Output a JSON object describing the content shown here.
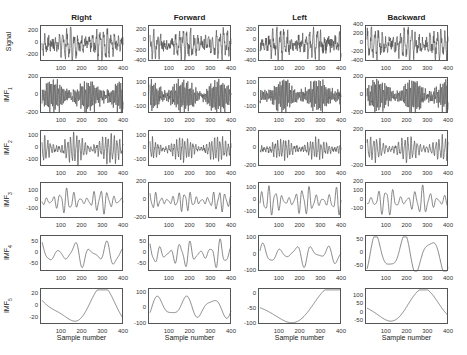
{
  "chart_data": {
    "type": "line",
    "layout": "6x4 grid of subplots",
    "columns": [
      "Right",
      "Forward",
      "Left",
      "Backward"
    ],
    "rows": [
      "Signal",
      "IMF1",
      "IMF2",
      "IMF3",
      "IMF4",
      "IMF5"
    ],
    "xlabel": "Sample number",
    "xlim": [
      0,
      400
    ],
    "xticks": [
      100,
      200,
      300,
      400
    ],
    "grid": false,
    "panels": [
      {
        "row": "Signal",
        "col": "Right",
        "yticks": [
          200,
          0,
          -200
        ],
        "ylim": [
          -300,
          300
        ],
        "freq": 22,
        "amp": 0.75,
        "noise": 0.5
      },
      {
        "row": "Signal",
        "col": "Forward",
        "yticks": [
          200,
          0,
          -200,
          -400
        ],
        "ylim": [
          -400,
          300
        ],
        "freq": 22,
        "amp": 0.7,
        "noise": 0.5
      },
      {
        "row": "Signal",
        "col": "Left",
        "yticks": [
          200,
          0,
          -200,
          -400
        ],
        "ylim": [
          -400,
          300
        ],
        "freq": 22,
        "amp": 0.7,
        "noise": 0.5
      },
      {
        "row": "Signal",
        "col": "Backward",
        "yticks": [
          400,
          200,
          0,
          -200,
          -400
        ],
        "ylim": [
          -400,
          400
        ],
        "freq": 22,
        "amp": 0.7,
        "noise": 0.5
      },
      {
        "row": "IMF1",
        "col": "Right",
        "yticks": [
          200,
          0,
          -200
        ],
        "ylim": [
          -200,
          200
        ],
        "freq": 60,
        "amp": 0.8,
        "noise": 0.3
      },
      {
        "row": "IMF1",
        "col": "Forward",
        "yticks": [
          100,
          0,
          -100
        ],
        "ylim": [
          -150,
          150
        ],
        "freq": 60,
        "amp": 0.8,
        "noise": 0.3
      },
      {
        "row": "IMF1",
        "col": "Left",
        "yticks": [
          100,
          0,
          -100
        ],
        "ylim": [
          -150,
          150
        ],
        "freq": 60,
        "amp": 0.8,
        "noise": 0.3
      },
      {
        "row": "IMF1",
        "col": "Backward",
        "yticks": [
          200,
          0,
          -200
        ],
        "ylim": [
          -200,
          200
        ],
        "freq": 60,
        "amp": 0.8,
        "noise": 0.3
      },
      {
        "row": "IMF2",
        "col": "Right",
        "yticks": [
          100,
          0,
          -100
        ],
        "ylim": [
          -150,
          150
        ],
        "freq": 28,
        "amp": 0.75,
        "noise": 0.15
      },
      {
        "row": "IMF2",
        "col": "Forward",
        "yticks": [
          100,
          0,
          -100
        ],
        "ylim": [
          -150,
          150
        ],
        "freq": 30,
        "amp": 0.6,
        "noise": 0.15
      },
      {
        "row": "IMF2",
        "col": "Left",
        "yticks": [
          200,
          0,
          -200
        ],
        "ylim": [
          -200,
          200
        ],
        "freq": 30,
        "amp": 0.5,
        "noise": 0.15
      },
      {
        "row": "IMF2",
        "col": "Backward",
        "yticks": [
          200,
          0,
          -200
        ],
        "ylim": [
          -200,
          200
        ],
        "freq": 26,
        "amp": 0.6,
        "noise": 0.1
      },
      {
        "row": "IMF3",
        "col": "Right",
        "yticks": [
          100,
          0,
          -100
        ],
        "ylim": [
          -200,
          200
        ],
        "freq": 12,
        "amp": 0.6,
        "noise": 0
      },
      {
        "row": "IMF3",
        "col": "Forward",
        "yticks": [
          200,
          0,
          -200
        ],
        "ylim": [
          -200,
          200
        ],
        "freq": 14,
        "amp": 0.5,
        "noise": 0
      },
      {
        "row": "IMF3",
        "col": "Left",
        "yticks": [
          100,
          0,
          -100
        ],
        "ylim": [
          -150,
          150
        ],
        "freq": 12,
        "amp": 0.7,
        "noise": 0
      },
      {
        "row": "IMF3",
        "col": "Backward",
        "yticks": [
          200,
          100,
          0,
          -100
        ],
        "ylim": [
          -200,
          200
        ],
        "freq": 11,
        "amp": 0.7,
        "noise": 0
      },
      {
        "row": "IMF4",
        "col": "Right",
        "yticks": [
          50,
          0,
          -50
        ],
        "ylim": [
          -80,
          80
        ],
        "freq": 5,
        "amp": 0.7,
        "noise": 0
      },
      {
        "row": "IMF4",
        "col": "Forward",
        "yticks": [
          50,
          0,
          -50
        ],
        "ylim": [
          -80,
          80
        ],
        "freq": 8,
        "amp": 0.7,
        "noise": 0
      },
      {
        "row": "IMF4",
        "col": "Left",
        "yticks": [
          100,
          0,
          -100
        ],
        "ylim": [
          -100,
          120
        ],
        "freq": 5,
        "amp": 0.6,
        "noise": 0
      },
      {
        "row": "IMF4",
        "col": "Backward",
        "yticks": [
          50,
          0,
          -50
        ],
        "ylim": [
          -70,
          70
        ],
        "freq": 3,
        "amp": 0.9,
        "noise": 0
      },
      {
        "row": "IMF5",
        "col": "Right",
        "yticks": [
          20,
          0,
          -20
        ],
        "ylim": [
          -30,
          30
        ],
        "freq": 1.2,
        "amp": 0.9,
        "noise": 0
      },
      {
        "row": "IMF5",
        "col": "Forward",
        "yticks": [
          100,
          0,
          -100
        ],
        "ylim": [
          -100,
          130
        ],
        "freq": 3,
        "amp": 0.5,
        "noise": 0
      },
      {
        "row": "IMF5",
        "col": "Left",
        "yticks": [
          0,
          -50,
          -100
        ],
        "ylim": [
          -100,
          20
        ],
        "freq": 0.8,
        "amp": 0.9,
        "noise": 0
      },
      {
        "row": "IMF5",
        "col": "Backward",
        "yticks": [
          100,
          50,
          0,
          -50
        ],
        "ylim": [
          -70,
          150
        ],
        "freq": 1,
        "amp": 0.8,
        "noise": 0
      }
    ]
  },
  "labels": {
    "titles": [
      "Right",
      "Forward",
      "Left",
      "Backward"
    ],
    "ylabels": [
      "Signal",
      "IMF1",
      "IMF2",
      "IMF3",
      "IMF4",
      "IMF5"
    ],
    "xlabel": "Sample number"
  },
  "colors": {
    "line": "#555555",
    "axis": "#555555"
  }
}
